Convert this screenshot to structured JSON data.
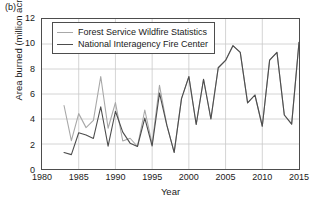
{
  "figure": {
    "panel_label": "(b)",
    "xlabel": "Year",
    "ylabel": "Area burned (million acres)"
  },
  "legend": {
    "items": [
      {
        "label": "Forest Service Wildfire Statistics",
        "color": "#a8a8a8"
      },
      {
        "label": "National Interagency Fire Center",
        "color": "#4d4d4d"
      }
    ]
  },
  "chart_data": {
    "type": "line",
    "title": "",
    "xlabel": "Year",
    "ylabel": "Area burned (million acres)",
    "xlim": [
      1980,
      2015
    ],
    "ylim": [
      0,
      12
    ],
    "xticks": [
      1980,
      1985,
      1990,
      1995,
      2000,
      2005,
      2010,
      2015
    ],
    "yticks": [
      0,
      2,
      4,
      6,
      8,
      10,
      12
    ],
    "grid": true,
    "legend_position": "upper-left",
    "series": [
      {
        "name": "Forest Service Wildfire Statistics",
        "color": "#a8a8a8",
        "x": [
          1983,
          1984,
          1985,
          1986,
          1987,
          1988,
          1989,
          1990,
          1991,
          1992,
          1993,
          1994,
          1995,
          1996,
          1997,
          1998,
          1999,
          2000,
          2001,
          2002,
          2003,
          2004,
          2005,
          2006,
          2007,
          2008,
          2009,
          2010,
          2011,
          2012,
          2013,
          2014,
          2015
        ],
        "values": [
          5.08,
          2.27,
          4.43,
          3.31,
          3.89,
          7.4,
          3.26,
          5.31,
          2.24,
          2.46,
          1.8,
          4.72,
          2.0,
          6.7,
          3.51,
          1.33,
          5.63,
          7.39,
          3.56,
          7.18,
          4.0,
          8.1,
          8.69,
          9.87,
          9.33,
          5.29,
          5.92,
          3.42,
          8.71,
          9.33,
          4.32,
          3.59,
          10.13
        ]
      },
      {
        "name": "National Interagency Fire Center",
        "color": "#4d4d4d",
        "x": [
          1983,
          1984,
          1985,
          1986,
          1987,
          1988,
          1989,
          1990,
          1991,
          1992,
          1993,
          1994,
          1995,
          1996,
          1997,
          1998,
          1999,
          2000,
          2001,
          2002,
          2003,
          2004,
          2005,
          2006,
          2007,
          2008,
          2009,
          2010,
          2011,
          2012,
          2013,
          2014,
          2015
        ],
        "values": [
          1.32,
          1.15,
          2.9,
          2.72,
          2.45,
          4.98,
          1.83,
          4.62,
          2.95,
          2.07,
          1.8,
          4.07,
          1.84,
          6.07,
          3.51,
          1.33,
          5.63,
          7.39,
          3.56,
          7.18,
          4.0,
          8.1,
          8.69,
          9.87,
          9.33,
          5.29,
          5.92,
          3.42,
          8.71,
          9.33,
          4.32,
          3.59,
          10.13
        ]
      }
    ]
  }
}
